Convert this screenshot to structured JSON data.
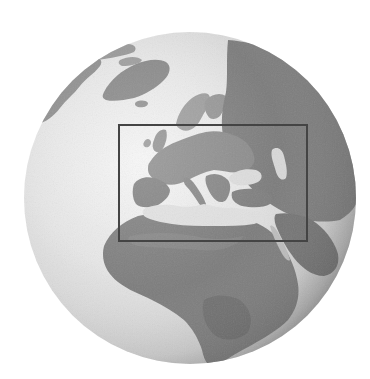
{
  "figure": {
    "type": "orthographic-globe",
    "title": "Globe centered on Europe and Africa with Europe highlighted",
    "width": 370,
    "height": 379,
    "background": "#ffffff"
  },
  "globe": {
    "center_x": 190,
    "center_y": 198,
    "radius": 166,
    "colors": {
      "ocean_highlight": "#f4f4f4",
      "ocean_mid": "#e2e2e2",
      "ocean_edge": "#a8a8a8",
      "land_light": "#9a9a9a",
      "land": "#8a8a8a",
      "land_dark": "#6e6e6e",
      "shade": "#5a5a5a"
    },
    "visible_regions": [
      "North America (Canadian Arctic)",
      "Greenland",
      "Iceland",
      "Europe",
      "Scandinavia",
      "Russia",
      "Mediterranean Sea",
      "Black Sea",
      "Caspian Sea",
      "Middle East",
      "Africa",
      "Arabian Peninsula"
    ]
  },
  "highlight_box": {
    "label": "Europe and Mediterranean region",
    "x": 119,
    "y": 125,
    "width": 188,
    "height": 116,
    "stroke": "#444444",
    "stroke_width": 2
  }
}
